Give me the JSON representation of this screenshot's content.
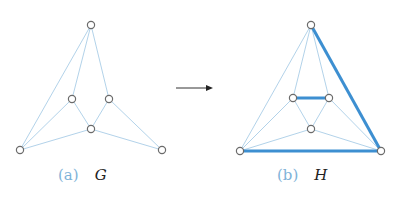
{
  "figure": {
    "arrow": {
      "x1": 176,
      "y1": 88,
      "x2": 213,
      "y2": 88
    },
    "graphs": [
      {
        "label": "(a)",
        "name": "G",
        "nodes": {
          "top": [
            91,
            25
          ],
          "lm": [
            72,
            99
          ],
          "rm": [
            109,
            99
          ],
          "c": [
            91,
            129
          ],
          "bl": [
            20,
            150
          ],
          "br": [
            162,
            150
          ]
        },
        "edges": [
          [
            "top",
            "bl"
          ],
          [
            "top",
            "lm"
          ],
          [
            "top",
            "rm"
          ],
          [
            "lm",
            "bl"
          ],
          [
            "lm",
            "c"
          ],
          [
            "rm",
            "c"
          ],
          [
            "rm",
            "br"
          ],
          [
            "c",
            "bl"
          ],
          [
            "c",
            "br"
          ]
        ],
        "thick_edges": []
      },
      {
        "label": "(b)",
        "name": "H",
        "nodes": {
          "top": [
            311,
            25
          ],
          "lm": [
            293,
            98
          ],
          "rm": [
            329,
            98
          ],
          "c": [
            311,
            129
          ],
          "bl": [
            240,
            151
          ],
          "br": [
            381,
            151
          ]
        },
        "edges": [
          [
            "top",
            "bl"
          ],
          [
            "top",
            "lm"
          ],
          [
            "top",
            "rm"
          ],
          [
            "lm",
            "bl"
          ],
          [
            "lm",
            "c"
          ],
          [
            "rm",
            "c"
          ],
          [
            "rm",
            "br"
          ],
          [
            "c",
            "bl"
          ],
          [
            "c",
            "br"
          ]
        ],
        "thick_edges": [
          [
            "top",
            "br"
          ],
          [
            "bl",
            "br"
          ],
          [
            "lm",
            "rm"
          ]
        ]
      }
    ],
    "colors": {
      "thin_edge": "#a9cde6",
      "thick_edge": "#3d8fd1",
      "node_stroke": "#6b6b6b",
      "label": "#7fb3d8"
    }
  }
}
